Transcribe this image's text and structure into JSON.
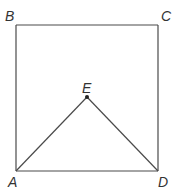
{
  "diagram": {
    "type": "geometry",
    "colors": {
      "line": "#4a4a4a",
      "label": "#333333",
      "point": "#222222",
      "background": "#ffffff"
    },
    "points": {
      "A": {
        "label": "A",
        "x": 16,
        "y": 171
      },
      "B": {
        "label": "B",
        "x": 16,
        "y": 25
      },
      "C": {
        "label": "C",
        "x": 158,
        "y": 25
      },
      "D": {
        "label": "D",
        "x": 158,
        "y": 171
      },
      "E": {
        "label": "E",
        "x": 87,
        "y": 97
      }
    },
    "segments": [
      [
        "A",
        "B"
      ],
      [
        "B",
        "C"
      ],
      [
        "C",
        "D"
      ],
      [
        "D",
        "A"
      ],
      [
        "A",
        "E"
      ],
      [
        "E",
        "D"
      ]
    ],
    "labels": {
      "A": "A",
      "B": "B",
      "C": "C",
      "D": "D",
      "E": "E"
    }
  }
}
